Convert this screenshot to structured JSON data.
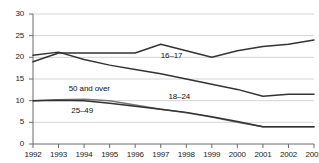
{
  "chart_data": {
    "type": "line",
    "title": "",
    "subtitle": "",
    "xlabel": "",
    "ylabel": "",
    "x": [
      1992,
      1993,
      1994,
      1995,
      1996,
      1997,
      1998,
      1999,
      2000,
      2001,
      2002,
      2003
    ],
    "xticklabels": [
      "1992",
      "1993",
      "1994",
      "1995",
      "1996",
      "1997",
      "1998",
      "1999",
      "2000",
      "2001",
      "2002",
      "2003"
    ],
    "yticklabels": [
      "0",
      "5",
      "10",
      "15",
      "20",
      "25",
      "30"
    ],
    "yticks": [
      0,
      5,
      10,
      15,
      20,
      25,
      30
    ],
    "ylim": [
      0,
      30
    ],
    "xlim": [
      1992,
      2003
    ],
    "grid": "horizontal",
    "legend": "inline-labels",
    "series": [
      {
        "name": "16–17",
        "label": "16–17",
        "color": "#333333",
        "values": [
          19.0,
          21.0,
          21.0,
          21.0,
          21.0,
          23.0,
          21.5,
          20.0,
          21.5,
          22.5,
          23.0,
          24.0
        ]
      },
      {
        "name": "18–24",
        "label": "18–24",
        "color": "#333333",
        "values": [
          20.5,
          21.2,
          19.5,
          18.2,
          17.2,
          16.2,
          15.0,
          13.8,
          12.6,
          11.0,
          11.5,
          11.5
        ]
      },
      {
        "name": "50 and over",
        "label": "50 and over",
        "color": "#777777",
        "values": [
          10.0,
          10.2,
          10.3,
          10.0,
          9.0,
          8.0,
          7.2,
          6.2,
          5.0,
          4.0,
          4.0,
          4.0
        ]
      },
      {
        "name": "25–49",
        "label": "25–49",
        "color": "#333333",
        "values": [
          10.0,
          10.1,
          10.0,
          9.4,
          8.7,
          8.0,
          7.3,
          6.3,
          5.2,
          4.0,
          4.0,
          4.0
        ]
      }
    ],
    "annotations": [
      {
        "text": "16–17",
        "x": 1997.0,
        "y": 20.2
      },
      {
        "text": "18–24",
        "x": 1997.3,
        "y": 10.9
      },
      {
        "text": "50 and over",
        "x": 1993.4,
        "y": 12.6
      },
      {
        "text": "25–49",
        "x": 1993.5,
        "y": 7.6
      }
    ]
  }
}
